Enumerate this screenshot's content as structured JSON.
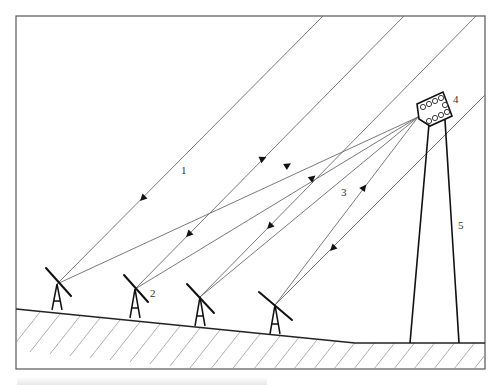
{
  "figure": {
    "labels": {
      "incident_ray": "1",
      "heliostat": "2",
      "reflected_ray": "3",
      "receiver": "4",
      "tower": "5"
    },
    "caption": "",
    "components": [
      {
        "id": "1",
        "name": "incident sunlight"
      },
      {
        "id": "2",
        "name": "heliostat"
      },
      {
        "id": "3",
        "name": "reflected sunlight"
      },
      {
        "id": "4",
        "name": "receiver"
      },
      {
        "id": "5",
        "name": "tower"
      }
    ],
    "colors": {
      "line": "#6a6a6a",
      "structure": "#111111",
      "background": "#ffffff"
    }
  }
}
